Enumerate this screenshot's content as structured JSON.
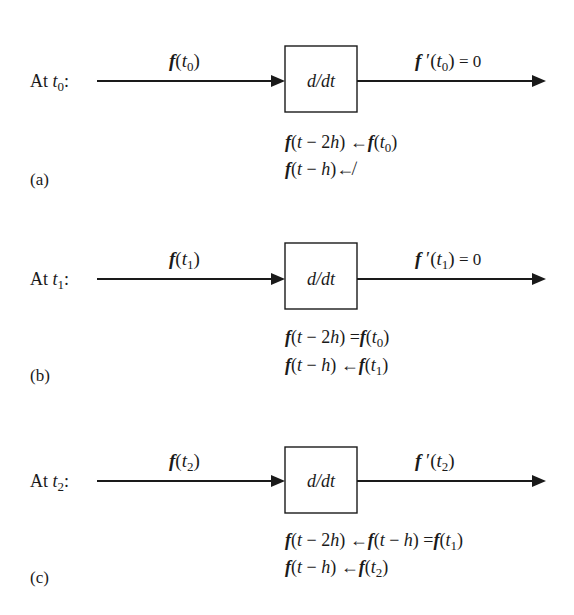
{
  "diagram": {
    "block_label": "d/dt",
    "panels": [
      {
        "id": "a",
        "tag": "(a)",
        "time_label": "At t0:",
        "time_prefix": "At ",
        "time_var": "t",
        "time_sub": "0",
        "input": {
          "f": "f",
          "arg": "t",
          "sub": "0"
        },
        "output": {
          "f": "f",
          "prime": "′",
          "arg": "t",
          "sub": "0",
          "suffix": " = 0"
        },
        "equations": [
          {
            "text": "f(t − 2h) ← f(t0)",
            "parts": [
              [
                "f",
                "bf"
              ],
              [
                "(",
                ""
              ],
              [
                "t",
                "it"
              ],
              [
                " − 2",
                ""
              ],
              [
                "h",
                "it"
              ],
              [
                ") ←",
                ""
              ],
              [
                "f",
                "bf"
              ],
              [
                "(",
                ""
              ],
              [
                "t",
                "it"
              ],
              [
                "0",
                "sub"
              ],
              [
                ")",
                ""
              ]
            ]
          },
          {
            "text": "f(t − h) ↚",
            "parts": [
              [
                "f",
                "bf"
              ],
              [
                "(",
                ""
              ],
              [
                "t",
                "it"
              ],
              [
                " − ",
                ""
              ],
              [
                "h",
                "it"
              ],
              [
                ")",
                ""
              ],
              [
                "↚",
                ""
              ]
            ]
          }
        ]
      },
      {
        "id": "b",
        "tag": "(b)",
        "time_label": "At t1:",
        "time_prefix": "At ",
        "time_var": "t",
        "time_sub": "1",
        "input": {
          "f": "f",
          "arg": "t",
          "sub": "1"
        },
        "output": {
          "f": "f",
          "prime": "′",
          "arg": "t",
          "sub": "1",
          "suffix": " = 0"
        },
        "equations": [
          {
            "text": "f(t − 2h) = f(t0)",
            "parts": [
              [
                "f",
                "bf"
              ],
              [
                "(",
                ""
              ],
              [
                "t",
                "it"
              ],
              [
                " − 2",
                ""
              ],
              [
                "h",
                "it"
              ],
              [
                ") =",
                ""
              ],
              [
                "f",
                "bf"
              ],
              [
                "(",
                ""
              ],
              [
                "t",
                "it"
              ],
              [
                "0",
                "sub"
              ],
              [
                ")",
                ""
              ]
            ]
          },
          {
            "text": "f(t − h) ← f(t1)",
            "parts": [
              [
                "f",
                "bf"
              ],
              [
                "(",
                ""
              ],
              [
                "t",
                "it"
              ],
              [
                " − ",
                ""
              ],
              [
                "h",
                "it"
              ],
              [
                ") ←",
                ""
              ],
              [
                "f",
                "bf"
              ],
              [
                "(",
                ""
              ],
              [
                "t",
                "it"
              ],
              [
                "1",
                "sub"
              ],
              [
                ")",
                ""
              ]
            ]
          }
        ]
      },
      {
        "id": "c",
        "tag": "(c)",
        "time_label": "At t2:",
        "time_prefix": "At ",
        "time_var": "t",
        "time_sub": "2",
        "input": {
          "f": "f",
          "arg": "t",
          "sub": "2"
        },
        "output": {
          "f": "f",
          "prime": "′",
          "arg": "t",
          "sub": "2",
          "suffix": ""
        },
        "equations": [
          {
            "text": "f(t − 2h) ← f(t − h) = f(t1)",
            "parts": [
              [
                "f",
                "bf"
              ],
              [
                "(",
                ""
              ],
              [
                "t",
                "it"
              ],
              [
                " − 2",
                ""
              ],
              [
                "h",
                "it"
              ],
              [
                ") ←",
                ""
              ],
              [
                "f",
                "bf"
              ],
              [
                "(",
                ""
              ],
              [
                "t",
                "it"
              ],
              [
                " − ",
                ""
              ],
              [
                "h",
                "it"
              ],
              [
                ") =",
                ""
              ],
              [
                "f",
                "bf"
              ],
              [
                "(",
                ""
              ],
              [
                "t",
                "it"
              ],
              [
                "1",
                "sub"
              ],
              [
                ")",
                ""
              ]
            ]
          },
          {
            "text": "f(t − h) ← f(t2)",
            "parts": [
              [
                "f",
                "bf"
              ],
              [
                "(",
                ""
              ],
              [
                "t",
                "it"
              ],
              [
                " − ",
                ""
              ],
              [
                "h",
                "it"
              ],
              [
                ") ←",
                ""
              ],
              [
                "f",
                "bf"
              ],
              [
                "(",
                ""
              ],
              [
                "t",
                "it"
              ],
              [
                "2",
                "sub"
              ],
              [
                ")",
                ""
              ]
            ]
          }
        ]
      }
    ]
  }
}
